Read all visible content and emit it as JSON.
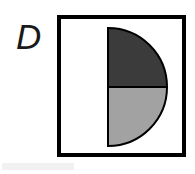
{
  "figure": {
    "panel_label": "D",
    "caption": "",
    "background_color": "#ffffff"
  },
  "frame": {
    "name": "square-frame",
    "border_color": "#000000",
    "border_width_px": 4,
    "fill_color": "#ffffff",
    "x_px": 57,
    "y_px": 15,
    "width_px": 129,
    "height_px": 142
  },
  "shape": {
    "name": "half-disc",
    "type": "semicircle",
    "orientation": "flat-edge-left",
    "outline_color": "#000000",
    "outline_width_px": 2,
    "center_x_px": 108,
    "center_y_px": 87,
    "radius_px": 59,
    "split": "horizontal-through-center",
    "total_fraction_of_circle": "1/2",
    "segments": [
      {
        "name": "upper-quarter",
        "label": "top",
        "fill_color": "#3b3b3b",
        "shade": "dark-gray",
        "fraction_of_circle": "1/4",
        "fraction_of_shape": "1/2",
        "angle_span_deg": 90
      },
      {
        "name": "lower-quarter",
        "label": "bottom",
        "fill_color": "#a2a2a2",
        "shade": "light-gray",
        "fraction_of_circle": "1/4",
        "fraction_of_shape": "1/2",
        "angle_span_deg": 90
      }
    ]
  },
  "colors": {
    "ink": "#000000",
    "label_ink": "#1a1a1a",
    "dark_fill": "#3b3b3b",
    "light_fill": "#a2a2a2",
    "paper": "#ffffff",
    "artifact": "#efefef"
  }
}
